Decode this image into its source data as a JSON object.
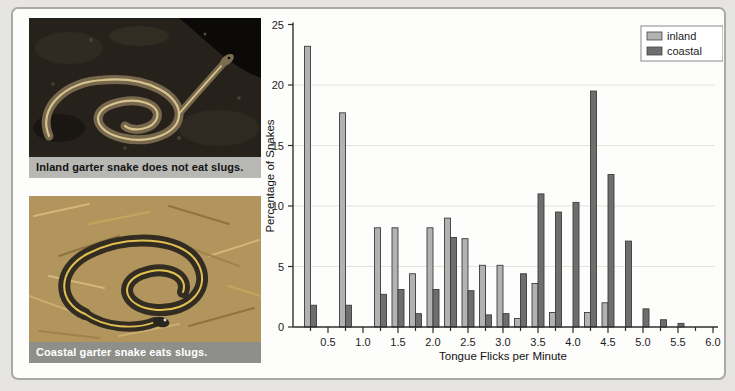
{
  "photos": {
    "inland": {
      "caption": "Inland garter snake does not eat slugs."
    },
    "coastal": {
      "caption": "Coastal garter snake eats slugs."
    }
  },
  "legend": {
    "items": [
      "inland",
      "coastal"
    ]
  },
  "colors": {
    "inland_bar": "#b2b2b2",
    "coastal_bar": "#6e6e6e",
    "bar_outline": "#3c3c3c",
    "axis": "#2e2e2e",
    "gridline": "#e3e3df",
    "panel_border": "#a9a9a7",
    "inland_caption_bg": "#b7b7b4",
    "coastal_caption_bg": "#8e8e8b"
  },
  "chart_data": {
    "type": "bar",
    "title": "",
    "xlabel": "Tongue Flicks per Minute",
    "ylabel": "Percentage of Snakes",
    "ylim": [
      0,
      25
    ],
    "xlim": [
      0,
      6
    ],
    "grid": "horizontal",
    "legend_position": "top-right",
    "bin_width": 0.25,
    "yticks": [
      0,
      5,
      10,
      15,
      20,
      25
    ],
    "xtick_labels": [
      "0.5",
      "1.0",
      "1.5",
      "2.0",
      "2.5",
      "3.0",
      "3.5",
      "4.0",
      "4.5",
      "5.0",
      "5.5",
      "6.0"
    ],
    "minor_tick_interval": 0.25,
    "categories": [
      0.25,
      0.75,
      1.25,
      1.5,
      1.75,
      2.0,
      2.25,
      2.5,
      2.75,
      3.0,
      3.25,
      3.5,
      3.75,
      4.0,
      4.25,
      4.5,
      4.75,
      5.0,
      5.25,
      5.5
    ],
    "series": [
      {
        "name": "inland",
        "color": "#b2b2b2",
        "values": [
          23.2,
          17.7,
          8.2,
          8.2,
          4.4,
          8.2,
          9.0,
          7.3,
          5.1,
          5.1,
          0.7,
          3.6,
          1.2,
          0,
          1.2,
          2.0,
          0,
          0,
          0,
          0
        ]
      },
      {
        "name": "coastal",
        "color": "#6e6e6e",
        "values": [
          1.8,
          1.8,
          2.7,
          3.1,
          1.1,
          3.1,
          7.4,
          3.0,
          1.0,
          1.1,
          4.4,
          11.0,
          9.5,
          10.3,
          19.5,
          12.6,
          7.1,
          1.5,
          0.6,
          0.3
        ]
      }
    ],
    "bar_outline": "#3c3c3c"
  }
}
